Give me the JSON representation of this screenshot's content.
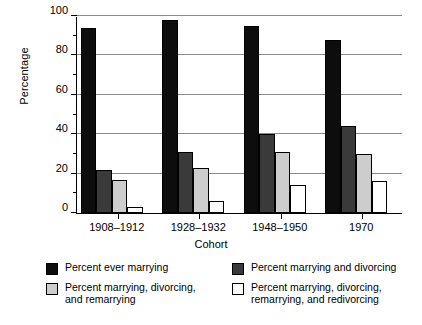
{
  "chart_data": {
    "type": "bar",
    "title": "",
    "xlabel": "Cohort",
    "ylabel": "Percentage",
    "categories": [
      "1908–1912",
      "1928–1932",
      "1948–1950",
      "1970"
    ],
    "series": [
      {
        "name": "Percent ever marrying",
        "color": "#0d0d0d",
        "values": [
          94,
          98,
          95,
          88
        ]
      },
      {
        "name": "Percent marrying and divorcing",
        "color": "#3a3a3a",
        "values": [
          22,
          31,
          40,
          44
        ]
      },
      {
        "name": "Percent marrying, divorcing,\nand remarrying",
        "color": "#cdcdcd",
        "values": [
          17,
          23,
          31,
          30
        ]
      },
      {
        "name": "Percent marrying, divorcing,\nremarrying, and redivorcing",
        "color": "#ffffff",
        "values": [
          3,
          6,
          14,
          16
        ]
      }
    ],
    "ylim": [
      0,
      100
    ],
    "yticks": [
      0,
      20,
      40,
      60,
      80,
      100
    ],
    "yticks_minor": [
      10,
      30,
      50,
      70,
      90
    ],
    "grid": "horizontal",
    "legend_position": "bottom"
  },
  "legend": {
    "entries": [
      {
        "label": "Percent ever marrying",
        "color": "#0d0d0d"
      },
      {
        "label": "Percent marrying and divorcing",
        "color": "#3a3a3a"
      },
      {
        "label": "Percent marrying, divorcing,\nand remarrying",
        "color": "#cdcdcd"
      },
      {
        "label": "Percent marrying, divorcing,\nremarrying, and redivorcing",
        "color": "#ffffff"
      }
    ]
  }
}
